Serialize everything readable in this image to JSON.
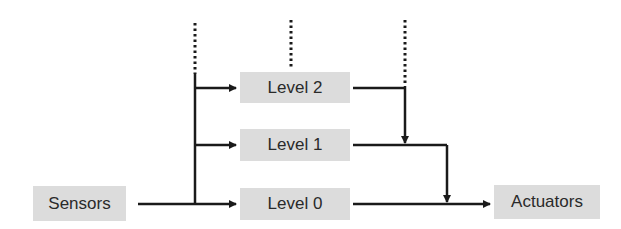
{
  "diagram": {
    "type": "layered control architecture",
    "nodes": {
      "sensors": "Sensors",
      "level2": "Level 2",
      "level1": "Level 1",
      "level0": "Level 0",
      "actuators": "Actuators"
    },
    "colors": {
      "box_fill": "#dcdcdc",
      "line": "#1a1a1a",
      "text": "#2a2a2a"
    },
    "edges": [
      {
        "from": "Sensors",
        "to": "Level 0"
      },
      {
        "from": "Sensors",
        "to": "Level 1"
      },
      {
        "from": "Sensors",
        "to": "Level 2"
      },
      {
        "from": "Level 2",
        "to": "Level 1 output"
      },
      {
        "from": "Level 1",
        "to": "Level 0 output"
      },
      {
        "from": "Level 0",
        "to": "Actuators"
      }
    ]
  }
}
